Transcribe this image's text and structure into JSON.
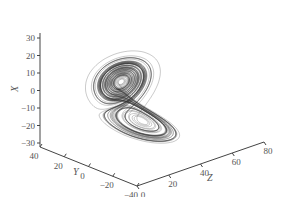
{
  "chart_data": {
    "type": "line",
    "subtype": "3d-trajectory",
    "title": "",
    "axes": {
      "x": {
        "label": "X",
        "ticks": [
          30,
          20,
          10,
          0,
          -10,
          -20,
          -30
        ],
        "range": [
          -30,
          30
        ]
      },
      "y": {
        "label": "Y",
        "ticks": [
          40,
          20,
          0,
          -20,
          -40
        ],
        "range": [
          -40,
          40
        ]
      },
      "z": {
        "label": "Z",
        "ticks": [
          0,
          20,
          40,
          60,
          80
        ],
        "range": [
          0,
          80
        ]
      }
    },
    "series": [
      {
        "name": "trajectory",
        "color": "#333333",
        "lobes": [
          {
            "center_screen": [
              158,
              56
            ],
            "approx_xyz_center": [
              8,
              8,
              27
            ]
          },
          {
            "center_screen": [
              178,
              117
            ],
            "approx_xyz_center": [
              -8,
              -8,
              27
            ]
          }
        ]
      }
    ],
    "grid": false,
    "legend": null
  },
  "labels": {
    "x_axis": "X",
    "y_axis": "Y",
    "z_axis": "Z",
    "x_ticks": [
      "30",
      "20",
      "10",
      "0",
      "−10",
      "−20",
      "−30"
    ],
    "y_ticks": [
      "40",
      "20",
      "0",
      "−20",
      "−40"
    ],
    "z_ticks": [
      "0",
      "20",
      "40",
      "60",
      "80"
    ]
  }
}
